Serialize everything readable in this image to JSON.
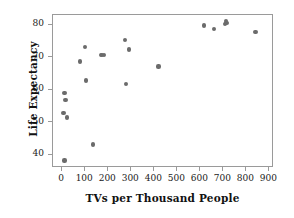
{
  "chart_data": {
    "type": "scatter",
    "title": "",
    "xlabel": "TVs per Thousand People",
    "ylabel": "Life Expectancy",
    "xlim": [
      -40,
      920
    ],
    "ylim": [
      36,
      83
    ],
    "grid": false,
    "legend": null,
    "xticks": [
      0,
      100,
      200,
      300,
      400,
      500,
      600,
      700,
      800,
      900
    ],
    "yticks": [
      40,
      50,
      60,
      70,
      80
    ],
    "xticklabels": [
      "0",
      "100",
      "200",
      "300",
      "400",
      "500",
      "600",
      "700",
      "800",
      "900"
    ],
    "yticklabels": [
      "40",
      "50",
      "60",
      "70",
      "80"
    ],
    "marker": {
      "shape": "circle",
      "color": "#6b6b6b",
      "size": 4
    },
    "series": [
      {
        "name": "countries",
        "points": [
          {
            "x": 10,
            "y": 38.3
          },
          {
            "x": 6,
            "y": 53.0
          },
          {
            "x": 10,
            "y": 59.1
          },
          {
            "x": 14,
            "y": 57.0
          },
          {
            "x": 21,
            "y": 51.5
          },
          {
            "x": 78,
            "y": 68.7
          },
          {
            "x": 100,
            "y": 73.2
          },
          {
            "x": 103,
            "y": 62.9
          },
          {
            "x": 135,
            "y": 43.2
          },
          {
            "x": 168,
            "y": 70.8
          },
          {
            "x": 174,
            "y": 70.7
          },
          {
            "x": 180,
            "y": 70.7
          },
          {
            "x": 272,
            "y": 75.3
          },
          {
            "x": 276,
            "y": 61.8
          },
          {
            "x": 291,
            "y": 72.4
          },
          {
            "x": 418,
            "y": 67.2
          },
          {
            "x": 616,
            "y": 79.8
          },
          {
            "x": 658,
            "y": 78.6
          },
          {
            "x": 708,
            "y": 80.3
          },
          {
            "x": 712,
            "y": 81.2
          },
          {
            "x": 714,
            "y": 80.6
          },
          {
            "x": 840,
            "y": 77.9
          }
        ]
      }
    ]
  },
  "colors": {
    "marker": "#6b6b6b",
    "frame": "#9a9a9a",
    "text": "#111111",
    "background": "#ffffff"
  }
}
